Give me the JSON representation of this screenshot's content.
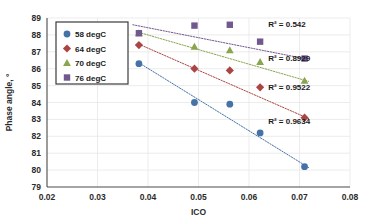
{
  "chart_data": {
    "type": "scatter",
    "title": "",
    "xlabel": "ICO",
    "ylabel": "Phase angle, °",
    "xlim": [
      0.02,
      0.08
    ],
    "ylim": [
      79,
      89
    ],
    "xticks": [
      "0.02",
      "0.03",
      "0.04",
      "0.05",
      "0.06",
      "0.07",
      "0.08"
    ],
    "yticks": [
      "79",
      "80",
      "81",
      "82",
      "83",
      "84",
      "85",
      "86",
      "87",
      "88",
      "89"
    ],
    "grid": true,
    "legend_position": "upper-left",
    "series": [
      {
        "name": "58 degC",
        "color": "#4573a7",
        "marker": "circle",
        "r2_text": "R² = 0.9634",
        "points": [
          {
            "x": 0.0382,
            "y": 86.3
          },
          {
            "x": 0.0492,
            "y": 84.0
          },
          {
            "x": 0.0562,
            "y": 83.9
          },
          {
            "x": 0.0622,
            "y": 82.2
          },
          {
            "x": 0.071,
            "y": 80.2
          }
        ],
        "trend": {
          "x0": 0.0382,
          "y0": 86.35,
          "x1": 0.0718,
          "y1": 80.15
        }
      },
      {
        "name": "64 degC",
        "color": "#aa4544",
        "marker": "diamond",
        "r2_text": "R² = 0.9522",
        "points": [
          {
            "x": 0.0382,
            "y": 87.4
          },
          {
            "x": 0.0492,
            "y": 86.0
          },
          {
            "x": 0.0562,
            "y": 85.9
          },
          {
            "x": 0.0622,
            "y": 84.9
          },
          {
            "x": 0.071,
            "y": 83.1
          }
        ],
        "trend": {
          "x0": 0.0382,
          "y0": 87.45,
          "x1": 0.0718,
          "y1": 83.05
        }
      },
      {
        "name": "70 degC",
        "color": "#89a54e",
        "marker": "triangle",
        "r2_text": "R² = 0.8929",
        "points": [
          {
            "x": 0.0382,
            "y": 88.1
          },
          {
            "x": 0.0492,
            "y": 87.3
          },
          {
            "x": 0.0562,
            "y": 87.1
          },
          {
            "x": 0.0622,
            "y": 86.4
          },
          {
            "x": 0.071,
            "y": 85.3
          }
        ],
        "trend": {
          "x0": 0.0382,
          "y0": 88.15,
          "x1": 0.0718,
          "y1": 85.25
        }
      },
      {
        "name": "76 degC",
        "color": "#71588f",
        "marker": "square",
        "r2_text": "R² = 0.542",
        "points": [
          {
            "x": 0.0382,
            "y": 88.1
          },
          {
            "x": 0.0492,
            "y": 88.55
          },
          {
            "x": 0.0562,
            "y": 88.6
          },
          {
            "x": 0.0622,
            "y": 87.6
          },
          {
            "x": 0.071,
            "y": 86.6
          }
        ],
        "trend": {
          "x0": 0.037,
          "y0": 88.6,
          "x1": 0.0718,
          "y1": 86.55
        }
      }
    ],
    "annotations": [
      {
        "text": "R² = 0.542",
        "x": 0.0638,
        "y": 88.45
      },
      {
        "text": "R² = 0.8929",
        "x": 0.0638,
        "y": 86.45
      },
      {
        "text": "R² = 0.9522",
        "x": 0.0638,
        "y": 84.75
      },
      {
        "text": "R² = 0.9634",
        "x": 0.0638,
        "y": 82.75
      }
    ]
  },
  "legend": {
    "items": [
      {
        "label": "58 degC"
      },
      {
        "label": "64 degC"
      },
      {
        "label": "70 degC"
      },
      {
        "label": "76 degC"
      }
    ]
  }
}
